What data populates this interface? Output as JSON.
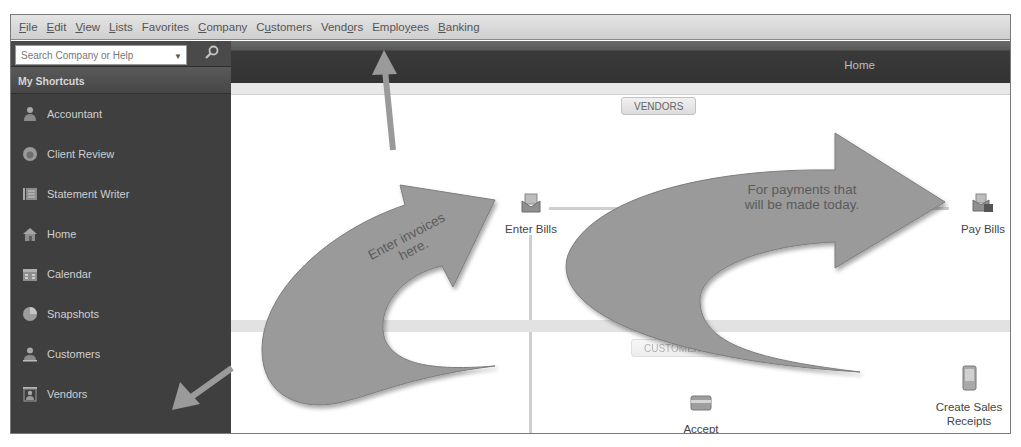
{
  "menu": {
    "items": [
      {
        "label": "File",
        "mnemonic_index": 0
      },
      {
        "label": "Edit",
        "mnemonic_index": 0
      },
      {
        "label": "View",
        "mnemonic_index": 0
      },
      {
        "label": "Lists",
        "mnemonic_index": 0
      },
      {
        "label": "Favorites",
        "mnemonic_index": -1
      },
      {
        "label": "Company",
        "mnemonic_index": 0
      },
      {
        "label": "Customers",
        "mnemonic_index": 1
      },
      {
        "label": "Vendors",
        "mnemonic_index": 4
      },
      {
        "label": "Employees",
        "mnemonic_index": 5
      },
      {
        "label": "Banking",
        "mnemonic_index": 0
      }
    ]
  },
  "sidebar": {
    "search": {
      "placeholder": "Search Company or Help"
    },
    "header": "My Shortcuts",
    "items": [
      {
        "label": "Accountant",
        "icon": "accountant-icon"
      },
      {
        "label": "Client Review",
        "icon": "client-review-icon"
      },
      {
        "label": "Statement Writer",
        "icon": "statement-writer-icon"
      },
      {
        "label": "Home",
        "icon": "home-icon"
      },
      {
        "label": "Calendar",
        "icon": "calendar-icon"
      },
      {
        "label": "Snapshots",
        "icon": "snapshots-icon"
      },
      {
        "label": "Customers",
        "icon": "customers-icon"
      },
      {
        "label": "Vendors",
        "icon": "vendors-icon"
      }
    ]
  },
  "header": {
    "title": "Home"
  },
  "main": {
    "sections": {
      "vendors": "VENDORS",
      "customers": "CUSTOMERS"
    },
    "tasks": {
      "enter_bills": "Enter Bills",
      "pay_bills": "Pay Bills",
      "accept_credit_cards_line1": "Accept",
      "accept_credit_cards_line2": "Credit Cards",
      "create_sales_receipts_line1": "Create Sales",
      "create_sales_receipts_line2": "Receipts"
    }
  },
  "annotations": {
    "callout_left_line1": "Enter invoices",
    "callout_left_line2": "here.",
    "callout_right_line1": "For payments that",
    "callout_right_line2": "will  be made today.",
    "arrow_color": "#9a9a9a"
  }
}
